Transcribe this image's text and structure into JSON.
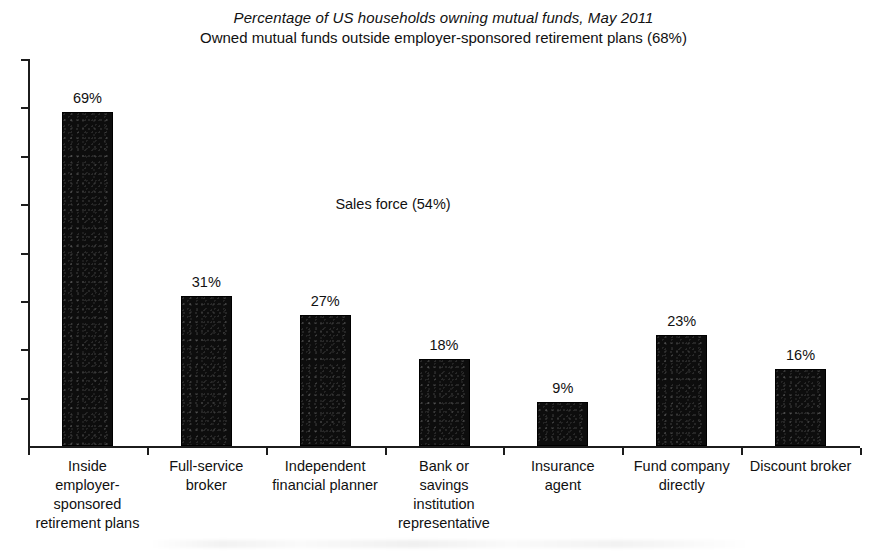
{
  "chart_data": {
    "type": "bar",
    "title": "Percentage of US households owning mutual funds, May 2011",
    "subtitle": "Owned mutual funds outside employer-sponsored retirement plans (68%)",
    "xlabel": "",
    "ylabel": "",
    "ylim": [
      0,
      80
    ],
    "grid": false,
    "legend": "none",
    "y_axis_tick_values": [
      0,
      10,
      20,
      30,
      40,
      50,
      60,
      70,
      80
    ],
    "y_axis_tick_labels_shown": false,
    "categories": [
      "Inside employer-sponsored retirement plans",
      "Full-service broker",
      "Independent financial planner",
      "Bank or savings institution representative",
      "Insurance agent",
      "Fund company directly",
      "Discount broker"
    ],
    "category_label_lines": [
      [
        "Inside",
        "employer-",
        "sponsored",
        "retirement plans"
      ],
      [
        "Full-service",
        "broker"
      ],
      [
        "Independent",
        "financial planner"
      ],
      [
        "Bank or",
        "savings",
        "institution",
        "representative"
      ],
      [
        "Insurance",
        "agent"
      ],
      [
        "Fund company",
        "directly"
      ],
      [
        "Discount broker"
      ]
    ],
    "values": [
      69,
      31,
      27,
      18,
      9,
      23,
      16
    ],
    "value_labels": [
      "69%",
      "31%",
      "27%",
      "18%",
      "9%",
      "23%",
      "16%"
    ],
    "annotations": [
      {
        "text": "Sales force (54%)",
        "x_px": 393,
        "y_px": 205
      }
    ],
    "bar_color": "#0d0d0d",
    "axis_color": "#1c1c1c",
    "background_color": "#ffffff"
  }
}
